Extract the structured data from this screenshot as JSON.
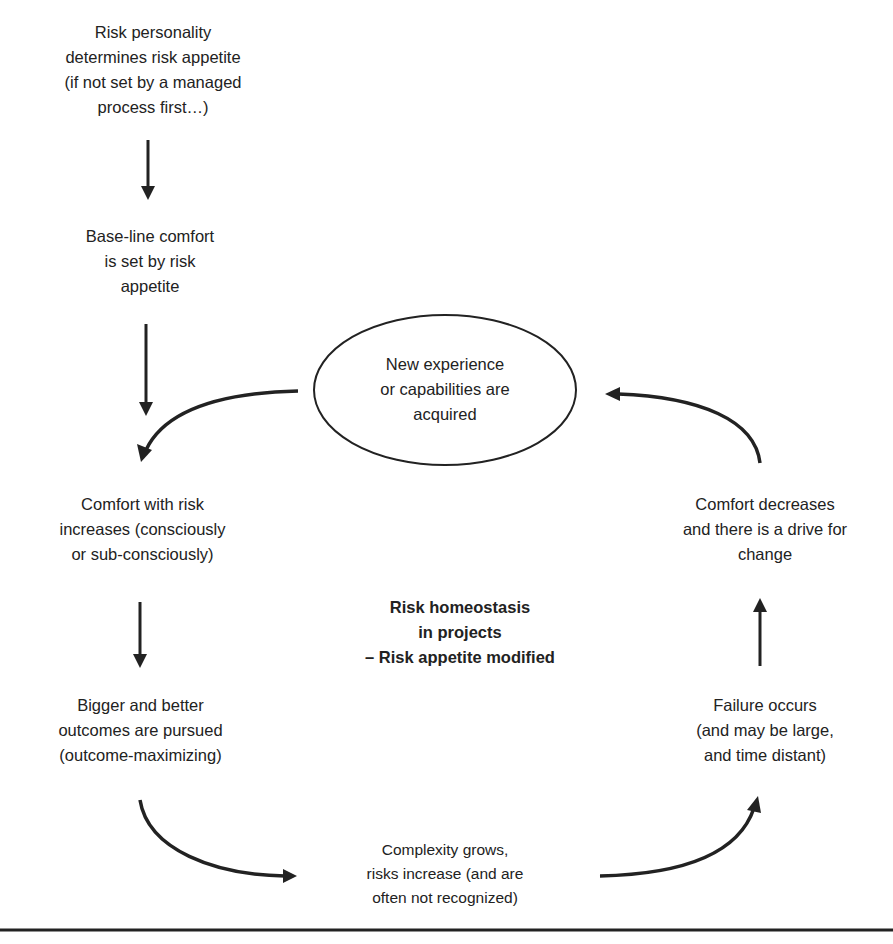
{
  "diagram": {
    "title_center": {
      "line1": "Risk homeostasis",
      "line2": "in projects",
      "line3": "– Risk appetite modified"
    },
    "nodes": [
      {
        "id": "risk-personality",
        "lines": [
          "Risk personality",
          "determines risk appetite",
          "(if not set by a managed",
          "process first…)"
        ]
      },
      {
        "id": "baseline-comfort",
        "lines": [
          "Base-line comfort",
          "is set by risk",
          "appetite"
        ]
      },
      {
        "id": "comfort-increases",
        "lines": [
          "Comfort with risk",
          "increases (consciously",
          "or sub-consciously)"
        ]
      },
      {
        "id": "bigger-outcomes",
        "lines": [
          "Bigger and better",
          "outcomes are pursued",
          "(outcome-maximizing)"
        ]
      },
      {
        "id": "complexity-grows",
        "lines": [
          "Complexity grows,",
          "risks increase (and are",
          "often not recognized)"
        ]
      },
      {
        "id": "failure-occurs",
        "lines": [
          "Failure occurs",
          "(and may be large,",
          "and time distant)"
        ]
      },
      {
        "id": "comfort-decreases",
        "lines": [
          "Comfort decreases",
          "and there is a drive for",
          "change"
        ]
      },
      {
        "id": "new-experience",
        "lines": [
          "New experience",
          "or capabilities are",
          "acquired"
        ],
        "shape": "ellipse"
      }
    ],
    "edges": [
      {
        "from": "risk-personality",
        "to": "baseline-comfort",
        "style": "straight"
      },
      {
        "from": "baseline-comfort",
        "to": "comfort-increases",
        "style": "straight"
      },
      {
        "from": "new-experience",
        "to": "comfort-increases",
        "style": "curved"
      },
      {
        "from": "comfort-increases",
        "to": "bigger-outcomes",
        "style": "straight"
      },
      {
        "from": "bigger-outcomes",
        "to": "complexity-grows",
        "style": "curved"
      },
      {
        "from": "complexity-grows",
        "to": "failure-occurs",
        "style": "curved"
      },
      {
        "from": "failure-occurs",
        "to": "comfort-decreases",
        "style": "straight"
      },
      {
        "from": "comfort-decreases",
        "to": "new-experience",
        "style": "curved"
      }
    ],
    "colors": {
      "ink": "#222222",
      "background": "#ffffff"
    }
  }
}
